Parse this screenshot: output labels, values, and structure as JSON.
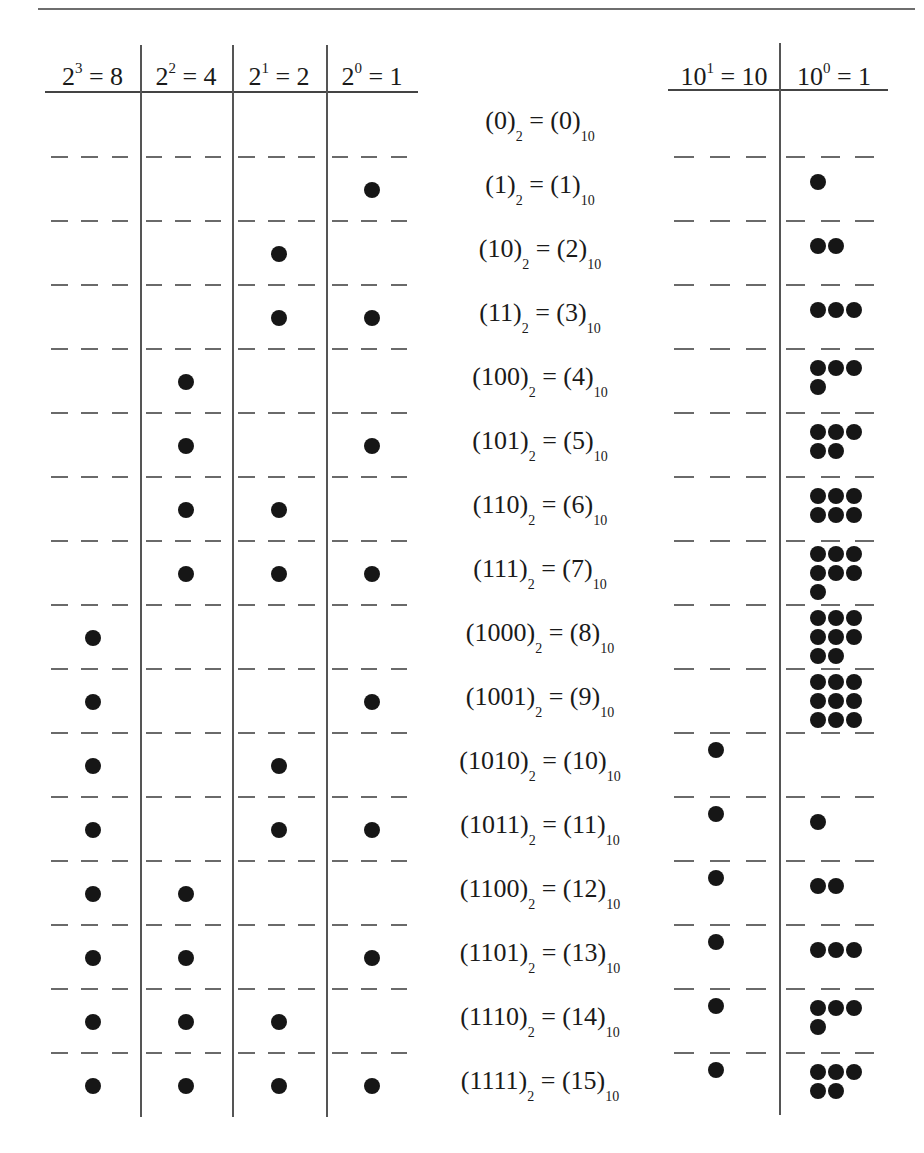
{
  "binary_table": {
    "headers": [
      {
        "base": "2",
        "exp": "3",
        "value": "8"
      },
      {
        "base": "2",
        "exp": "2",
        "value": "4"
      },
      {
        "base": "2",
        "exp": "1",
        "value": "2"
      },
      {
        "base": "2",
        "exp": "0",
        "value": "1"
      }
    ]
  },
  "decimal_table": {
    "headers": [
      {
        "base": "10",
        "exp": "1",
        "value": "10"
      },
      {
        "base": "10",
        "exp": "0",
        "value": "1"
      }
    ]
  },
  "rows": [
    {
      "binary": "0",
      "decimal": "0",
      "bits": [
        0,
        0,
        0,
        0
      ],
      "tens": 0,
      "ones": 0
    },
    {
      "binary": "1",
      "decimal": "1",
      "bits": [
        0,
        0,
        0,
        1
      ],
      "tens": 0,
      "ones": 1
    },
    {
      "binary": "10",
      "decimal": "2",
      "bits": [
        0,
        0,
        1,
        0
      ],
      "tens": 0,
      "ones": 2
    },
    {
      "binary": "11",
      "decimal": "3",
      "bits": [
        0,
        0,
        1,
        1
      ],
      "tens": 0,
      "ones": 3
    },
    {
      "binary": "100",
      "decimal": "4",
      "bits": [
        0,
        1,
        0,
        0
      ],
      "tens": 0,
      "ones": 4
    },
    {
      "binary": "101",
      "decimal": "5",
      "bits": [
        0,
        1,
        0,
        1
      ],
      "tens": 0,
      "ones": 5
    },
    {
      "binary": "110",
      "decimal": "6",
      "bits": [
        0,
        1,
        1,
        0
      ],
      "tens": 0,
      "ones": 6
    },
    {
      "binary": "111",
      "decimal": "7",
      "bits": [
        0,
        1,
        1,
        1
      ],
      "tens": 0,
      "ones": 7
    },
    {
      "binary": "1000",
      "decimal": "8",
      "bits": [
        1,
        0,
        0,
        0
      ],
      "tens": 0,
      "ones": 8
    },
    {
      "binary": "1001",
      "decimal": "9",
      "bits": [
        1,
        0,
        0,
        1
      ],
      "tens": 0,
      "ones": 9
    },
    {
      "binary": "1010",
      "decimal": "10",
      "bits": [
        1,
        0,
        1,
        0
      ],
      "tens": 1,
      "ones": 0
    },
    {
      "binary": "1011",
      "decimal": "11",
      "bits": [
        1,
        0,
        1,
        1
      ],
      "tens": 1,
      "ones": 1
    },
    {
      "binary": "1100",
      "decimal": "12",
      "bits": [
        1,
        1,
        0,
        0
      ],
      "tens": 1,
      "ones": 2
    },
    {
      "binary": "1101",
      "decimal": "13",
      "bits": [
        1,
        1,
        0,
        1
      ],
      "tens": 1,
      "ones": 3
    },
    {
      "binary": "1110",
      "decimal": "14",
      "bits": [
        1,
        1,
        1,
        0
      ],
      "tens": 1,
      "ones": 4
    },
    {
      "binary": "1111",
      "decimal": "15",
      "bits": [
        1,
        1,
        1,
        1
      ],
      "tens": 1,
      "ones": 5
    }
  ],
  "labels": {
    "binary_base": "2",
    "decimal_base": "10",
    "equals": "="
  },
  "colors": {
    "dot": "#161616",
    "rule": "#555555",
    "dash": "#6a6a6a"
  }
}
